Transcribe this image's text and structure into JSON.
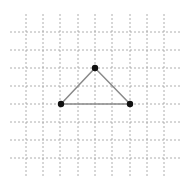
{
  "diagram": {
    "type": "triangle-on-grid",
    "grid": {
      "x_lines": [
        26,
        43,
        60,
        78,
        95,
        112,
        130,
        147,
        164
      ],
      "y_lines": [
        32,
        50,
        68,
        86,
        104,
        122,
        140,
        158
      ],
      "x_extent": [
        10,
        180
      ],
      "y_extent": [
        14,
        176
      ],
      "color": "#9a9a9a"
    },
    "triangle": {
      "stroke": "#8a8a8a",
      "point_color": "#111111",
      "vertices": [
        {
          "name": "top",
          "x": 95,
          "y": 68
        },
        {
          "name": "left",
          "x": 61,
          "y": 104
        },
        {
          "name": "right",
          "x": 130,
          "y": 104
        }
      ]
    }
  }
}
